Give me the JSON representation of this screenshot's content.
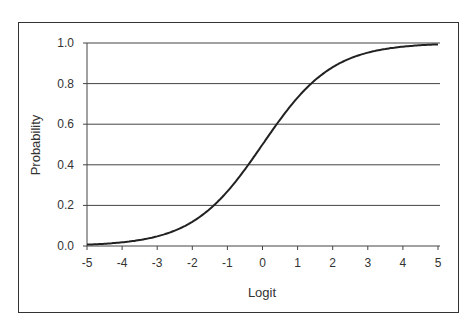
{
  "chart_data": {
    "type": "line",
    "title": "",
    "xlabel": "Logit",
    "ylabel": "Probability",
    "xlim": [
      -5,
      5
    ],
    "ylim": [
      0,
      1
    ],
    "xticks": [
      "-5",
      "-4",
      "-3",
      "-2",
      "-1",
      "0",
      "1",
      "2",
      "3",
      "4",
      "5"
    ],
    "yticks": [
      "0.0",
      "0.2",
      "0.4",
      "0.6",
      "0.8",
      "1.0"
    ],
    "grid": "horizontal",
    "legend": "none",
    "series": [
      {
        "name": "Probability",
        "x": [
          -5,
          -4,
          -3,
          -2,
          -1.5,
          -1,
          -0.5,
          0,
          0.5,
          1,
          1.5,
          2,
          3,
          4,
          5
        ],
        "values": [
          0.007,
          0.018,
          0.047,
          0.119,
          0.182,
          0.269,
          0.378,
          0.5,
          0.622,
          0.731,
          0.818,
          0.881,
          0.953,
          0.982,
          0.993
        ]
      }
    ]
  }
}
